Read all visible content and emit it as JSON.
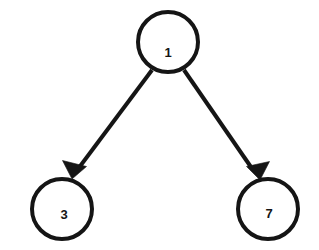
{
  "diagram": {
    "type": "directed-graph",
    "canvas": {
      "width": 319,
      "height": 250,
      "background": "#ffffff"
    },
    "style": {
      "node_stroke_color": "#151515",
      "node_fill_color": "#ffffff",
      "node_stroke_width": 4,
      "edge_color": "#151515",
      "edge_width": 4,
      "label_color": "#151515",
      "label_font_size": 13,
      "node_radius": 30
    },
    "nodes": [
      {
        "id": "node-1",
        "label": "1",
        "role": "root",
        "cx": 168,
        "cy": 42,
        "r": 30,
        "label_x": 168,
        "label_y": 54
      },
      {
        "id": "node-3",
        "label": "3",
        "role": "left-child",
        "cx": 62,
        "cy": 209,
        "r": 30,
        "label_x": 64,
        "label_y": 216
      },
      {
        "id": "node-7",
        "label": "7",
        "role": "right-child",
        "cx": 268,
        "cy": 209,
        "r": 30,
        "label_x": 269,
        "label_y": 215
      }
    ],
    "edges": [
      {
        "id": "edge-1-3",
        "from": "node-1",
        "to": "node-3",
        "direction": "down-left",
        "x1": 152,
        "y1": 70,
        "x2": 78,
        "y2": 169,
        "arrow_points": "72,179 62.5,160.5 86.5,166.5",
        "arrowhead": "filled-triangle"
      },
      {
        "id": "edge-1-7",
        "from": "node-1",
        "to": "node-7",
        "direction": "down-right",
        "x1": 184,
        "y1": 70,
        "x2": 253,
        "y2": 170,
        "arrow_points": "260,180 246.5,166.5 269.5,161.5",
        "arrowhead": "filled-triangle"
      }
    ]
  }
}
